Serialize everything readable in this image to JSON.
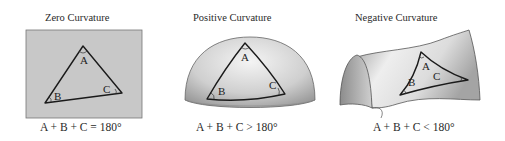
{
  "panels": [
    {
      "title": "Zero Curvature",
      "surface": "plane",
      "vertices": [
        "A",
        "B",
        "C"
      ],
      "equation": {
        "lhs": "A + B + C",
        "op": "=",
        "rhs": "180°"
      }
    },
    {
      "title": "Positive Curvature",
      "surface": "sphere",
      "vertices": [
        "A",
        "B",
        "C"
      ],
      "equation": {
        "lhs": "A + B + C",
        "op": ">",
        "rhs": "180°"
      }
    },
    {
      "title": "Negative Curvature",
      "surface": "saddle",
      "vertices": [
        "A",
        "B",
        "C"
      ],
      "equation": {
        "lhs": "A + B + C",
        "op": "<",
        "rhs": "180°"
      }
    }
  ],
  "colors": {
    "plane_fill": "#c8c8c8",
    "line": "#1a1a1a",
    "sphere_light": "#f2f2f2",
    "sphere_dark": "#9a9a9a",
    "saddle_light": "#f4f4f4",
    "saddle_dark": "#a8a8a8"
  }
}
